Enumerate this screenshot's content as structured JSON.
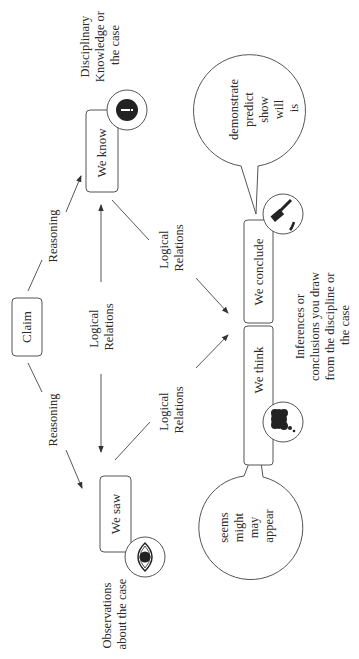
{
  "diagram": {
    "orientation": "rotated-90-ccw",
    "nodes": {
      "claim": {
        "label": "Claim"
      },
      "we_know": {
        "label": "We know",
        "icon": "info-icon"
      },
      "we_saw": {
        "label": "We saw",
        "icon": "eye-icon"
      },
      "we_think": {
        "label": "We think",
        "icon": "thought-cloud-icon"
      },
      "we_conclude": {
        "label": "We conclude",
        "icon": "gavel-icon"
      }
    },
    "edge_labels": {
      "reasoning_top": "Reasoning",
      "reasoning_bottom": "Reasoning",
      "logical_center_1": "Logical",
      "logical_center_2": "Relations",
      "logical_upper_1": "Logical",
      "logical_upper_2": "Relations",
      "logical_lower_1": "Logical",
      "logical_lower_2": "Relations"
    },
    "annotations": {
      "know_desc": [
        "Disciplinary",
        "Knowledge or",
        "the case"
      ],
      "saw_desc": [
        "Observations",
        "about the case"
      ],
      "infer_desc": [
        "Inferences or",
        "conclusions you draw",
        "from the discipline or",
        "the case"
      ]
    },
    "bubbles": {
      "conclude_words": [
        "demonstrate",
        "predict",
        "show",
        "will",
        "is"
      ],
      "think_words": [
        "seems",
        "might",
        "may",
        "appear"
      ]
    }
  }
}
